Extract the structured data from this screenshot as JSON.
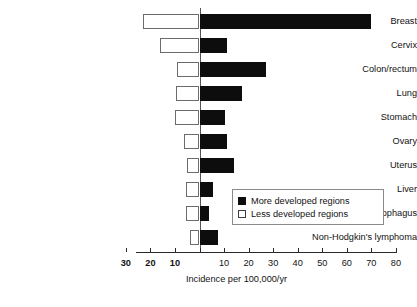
{
  "chart_data": {
    "type": "bar",
    "orientation": "horizontal-diverging",
    "title": "",
    "xlabel": "Incidence per 100,000/yr",
    "ylabel": "",
    "categories": [
      "Breast",
      "Cervix",
      "Colon/rectum",
      "Lung",
      "Stomach",
      "Ovary",
      "Uterus",
      "Liver",
      "Oesophagus",
      "Non-Hodgkin's lymphoma"
    ],
    "series": [
      {
        "name": "More developed regions",
        "direction": "right",
        "color": "#0d0d0d",
        "values": [
          70,
          11,
          27,
          17.5,
          10.5,
          11,
          14,
          5.5,
          4,
          7.5
        ]
      },
      {
        "name": "Less developed regions",
        "direction": "left",
        "color": "#ffffff",
        "values": [
          23,
          16,
          9,
          9.5,
          10,
          6.5,
          5,
          5.5,
          5.5,
          4
        ]
      }
    ],
    "axis": {
      "left_ticks": [
        30,
        20,
        10
      ],
      "center_tick": 0,
      "right_ticks": [
        10,
        20,
        30,
        40,
        50,
        60,
        70,
        80
      ],
      "left_max": 30,
      "right_max": 80,
      "grid": false
    },
    "legend": {
      "position": "inside-right-lower",
      "entries": [
        {
          "label": "More developed regions",
          "swatch": "filled-square"
        },
        {
          "label": "Less developed regions",
          "swatch": "open-square"
        }
      ]
    }
  },
  "axis_labels": {
    "left": [
      "30",
      "20",
      "10"
    ],
    "right": [
      "10",
      "20",
      "30",
      "40",
      "50",
      "60",
      "70",
      "80"
    ]
  },
  "legend": {
    "more": "More developed regions",
    "less": "Less developed regions"
  },
  "axis_title": "Incidence per 100,000/yr"
}
